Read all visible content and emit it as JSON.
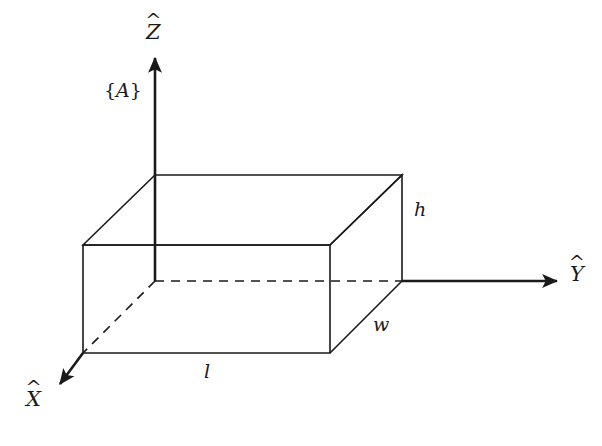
{
  "figure": {
    "type": "3d-box-with-coordinate-frame",
    "background_color": "#ffffff",
    "line_color": "#1a1a1a",
    "frame_label": {
      "braces_open": "{",
      "letter": "A",
      "braces_close": "}",
      "full_text": "{A}"
    },
    "axes": [
      {
        "name": "x-axis",
        "letter": "X",
        "accent": "hat",
        "label_text": "X̂",
        "direction": "down-left",
        "line_style": "solid",
        "has_arrowhead": true
      },
      {
        "name": "y-axis",
        "letter": "Y",
        "accent": "hat",
        "label_text": "Ŷ",
        "direction": "right",
        "line_style": "dashed-then-solid",
        "has_arrowhead": true
      },
      {
        "name": "z-axis",
        "letter": "Z",
        "accent": "hat",
        "label_text": "Ẑ",
        "direction": "up",
        "line_style": "solid",
        "has_arrowhead": true
      }
    ],
    "dimensions": [
      {
        "name": "height",
        "symbol": "h",
        "edge": "right-vertical-edge"
      },
      {
        "name": "width",
        "symbol": "w",
        "edge": "front-bottom-right-diagonal"
      },
      {
        "name": "length",
        "symbol": "l",
        "edge": "front-bottom-edge"
      }
    ]
  }
}
